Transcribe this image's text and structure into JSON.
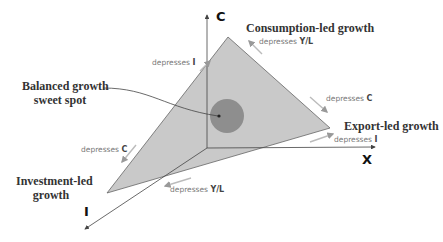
{
  "axes": {
    "c": "C",
    "x": "X",
    "i": "I"
  },
  "vertices": {
    "consumption": "Consumption-led growth",
    "export": "Export-led growth",
    "investment_line1": "Investment-led",
    "investment_line2": "growth"
  },
  "sweet_spot": {
    "line1": "Balanced growth",
    "line2": "sweet spot"
  },
  "effects": {
    "prefix": "depresses",
    "left_upper": "I",
    "top_right": "Y/L",
    "right_mid": "C",
    "right_low": "I",
    "left_lower": "C",
    "bottom": "Y/L"
  },
  "colors": {
    "triangle": "#c9c9c9",
    "spot": "#8e8e8e",
    "axis": "#444"
  }
}
